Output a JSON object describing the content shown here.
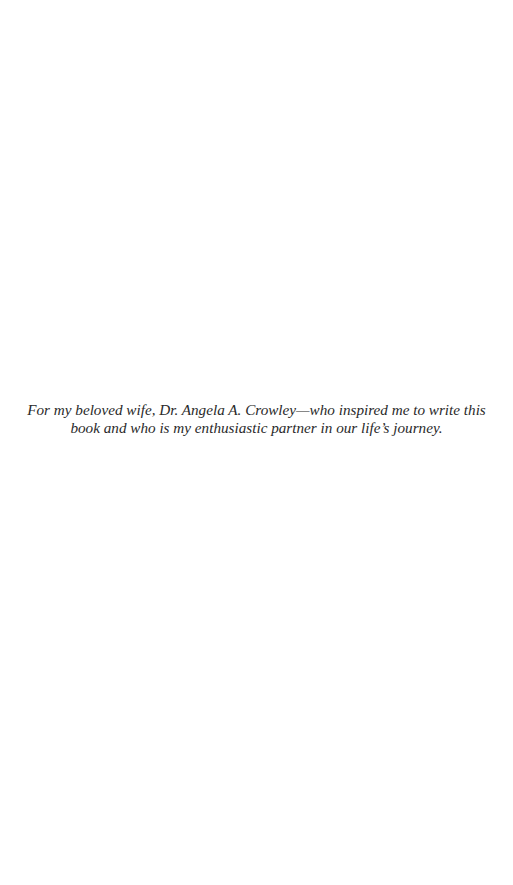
{
  "page": {
    "background": "#ffffff",
    "text_color": "#2a2a2a"
  },
  "dedication": {
    "lines": [
      "For my beloved wife, Dr. Angela A. Crowley—who inspired me to write this",
      "book and who is my enthusiastic partner in our life’s journey."
    ]
  }
}
